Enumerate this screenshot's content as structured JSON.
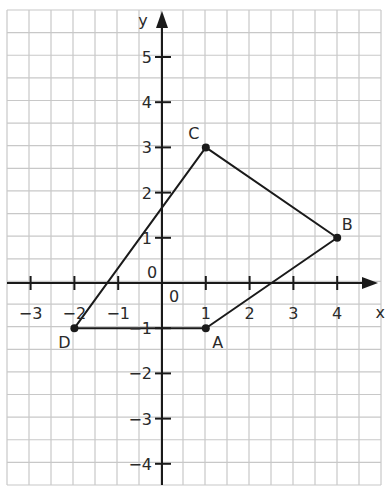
{
  "figure": {
    "type": "coordinate-grid-quadrilateral",
    "grid": {
      "left": 7,
      "top": 10,
      "right": 381,
      "bottom": 485,
      "cols": 17,
      "rows": 21,
      "color": "#c8c8c8"
    },
    "axes": {
      "origin_px": [
        162,
        283
      ],
      "unit_x_px": 43.8,
      "unit_y_px": 45.2,
      "x_label": "x",
      "y_label": "y",
      "x_ticks": [
        -3,
        -2,
        -1,
        1,
        2,
        3,
        4
      ],
      "y_ticks": [
        -4,
        -3,
        -2,
        -1,
        1,
        2,
        3,
        4,
        5
      ],
      "x_tick_labels": [
        "−3",
        "−2",
        "−1",
        "1",
        "2",
        "3",
        "4"
      ],
      "y_tick_labels": [
        "−4",
        "−3",
        "−2",
        "−1",
        "1",
        "2",
        "3",
        "4",
        "5"
      ],
      "origin_labels": [
        "0",
        "0"
      ],
      "color": "#1a1a1a"
    },
    "points": [
      {
        "name": "A",
        "x": 1,
        "y": -1
      },
      {
        "name": "B",
        "x": 4,
        "y": 1
      },
      {
        "name": "C",
        "x": 1,
        "y": 3
      },
      {
        "name": "D",
        "x": -2,
        "y": -1
      }
    ],
    "polygon_order": [
      "A",
      "B",
      "C",
      "D"
    ],
    "line_color": "#1a1a1a"
  }
}
